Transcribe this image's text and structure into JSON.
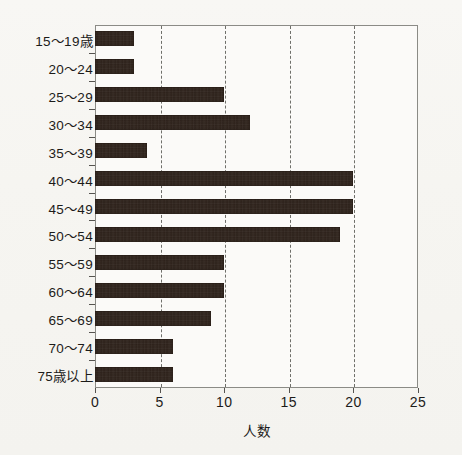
{
  "chart_data": {
    "type": "bar",
    "orientation": "horizontal",
    "title": "",
    "xlabel": "人数",
    "ylabel": "",
    "xlim": [
      0,
      25
    ],
    "xticks": [
      0,
      5,
      10,
      15,
      20,
      25
    ],
    "gridlines_x": [
      5,
      10,
      15,
      20
    ],
    "grid": "dashed vertical gridlines at 5, 10, 15, 20",
    "legend": "none",
    "categories": [
      "15～19歳",
      "20～24",
      "25～29",
      "30～34",
      "35～39",
      "40～44",
      "45～49",
      "50～54",
      "55～59",
      "60～64",
      "65～69",
      "70～74",
      "75歳以上"
    ],
    "values": [
      3,
      3,
      10,
      12,
      4,
      20,
      20,
      19,
      10,
      10,
      9,
      6,
      6
    ],
    "bar_color": "#2b1f18",
    "plot_background": "#fbfaf8",
    "page_background": "#f7f6f3"
  },
  "axis": {
    "x_tick_labels": [
      "0",
      "5",
      "10",
      "15",
      "20",
      "25"
    ],
    "x_title": "人数"
  }
}
